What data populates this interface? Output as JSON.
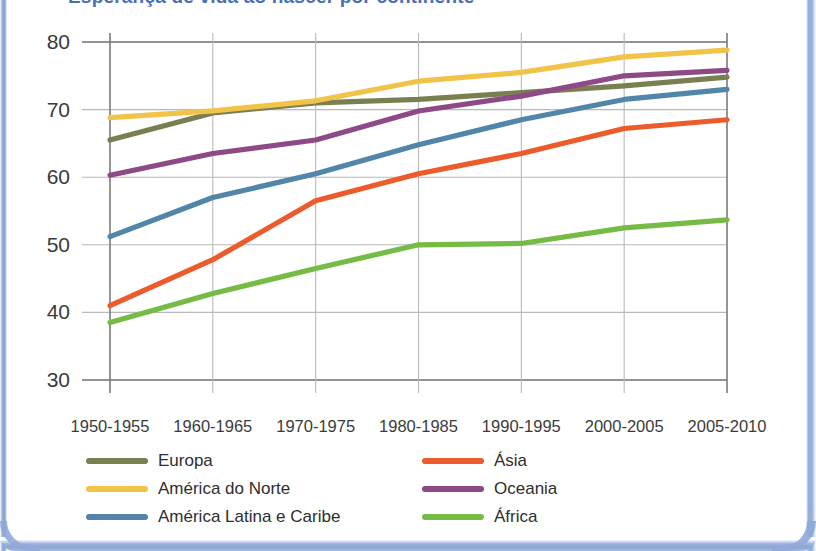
{
  "title": "Esperança de vida ao nascer por continente",
  "axes": {
    "y_ticks": [
      "80",
      "70",
      "60",
      "50",
      "40",
      "30"
    ],
    "x_ticks": [
      "1950-1955",
      "1960-1965",
      "1970-1975",
      "1980-1985",
      "1990-1995",
      "2000-2005",
      "2005-2010"
    ]
  },
  "legend": {
    "left": [
      {
        "label": "Europa",
        "color": "#7a7f51"
      },
      {
        "label": "América do Norte",
        "color": "#f2c349"
      },
      {
        "label": "América Latina e Caribe",
        "color": "#5286a8"
      }
    ],
    "right": [
      {
        "label": "Ásia",
        "color": "#ec5b2b"
      },
      {
        "label": "Oceania",
        "color": "#8e4a86"
      },
      {
        "label": "África",
        "color": "#76bb45"
      }
    ]
  },
  "chart_data": {
    "type": "line",
    "title": "Esperança de vida ao nascer por continente",
    "xlabel": "",
    "ylabel": "",
    "ylim": [
      30,
      80
    ],
    "ytick_step": 10,
    "grid": true,
    "legend_position": "bottom",
    "categories": [
      "1950-1955",
      "1960-1965",
      "1970-1975",
      "1980-1985",
      "1990-1995",
      "2000-2005",
      "2005-2010"
    ],
    "series": [
      {
        "name": "Europa",
        "color": "#7a7f51",
        "values": [
          65.5,
          69.5,
          71.0,
          71.5,
          72.5,
          73.5,
          74.8
        ]
      },
      {
        "name": "América do Norte",
        "color": "#f2c349",
        "values": [
          68.8,
          69.8,
          71.3,
          74.2,
          75.5,
          77.8,
          78.8
        ]
      },
      {
        "name": "América Latina e Caribe",
        "color": "#5286a8",
        "values": [
          51.2,
          57.0,
          60.5,
          64.8,
          68.5,
          71.5,
          73.0
        ]
      },
      {
        "name": "Ásia",
        "color": "#ec5b2b",
        "values": [
          41.0,
          47.8,
          56.5,
          60.5,
          63.5,
          67.2,
          68.5
        ]
      },
      {
        "name": "Oceania",
        "color": "#8e4a86",
        "values": [
          60.3,
          63.5,
          65.5,
          69.8,
          72.0,
          75.0,
          75.8
        ]
      },
      {
        "name": "África",
        "color": "#76bb45",
        "values": [
          38.5,
          42.8,
          46.5,
          50.0,
          50.2,
          52.5,
          53.7
        ]
      }
    ]
  }
}
